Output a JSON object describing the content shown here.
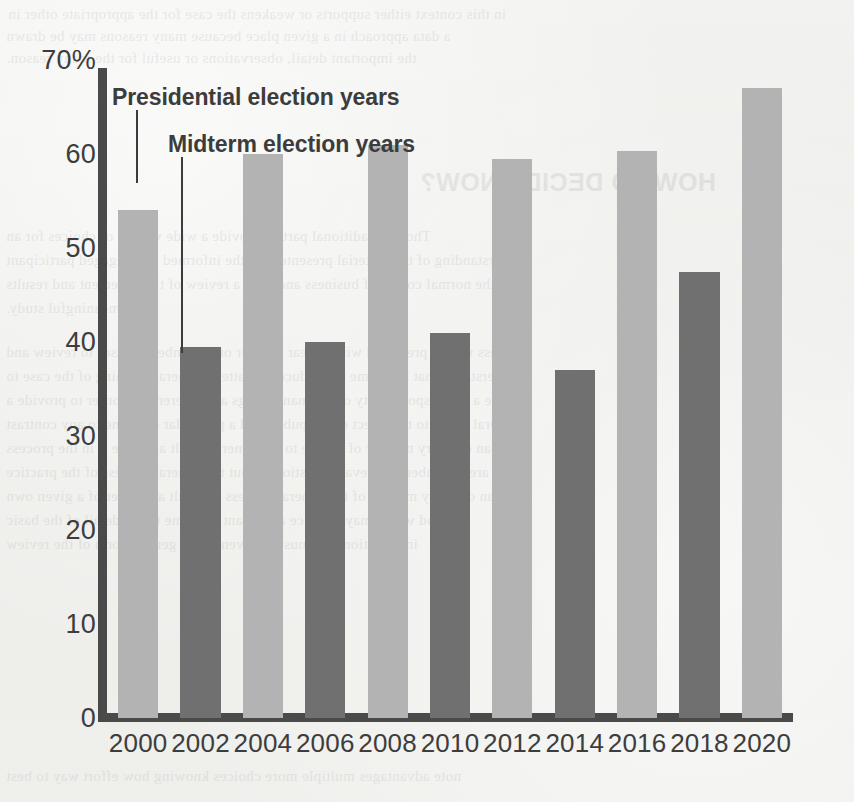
{
  "chart_data": {
    "type": "bar",
    "title": "",
    "xlabel": "",
    "ylabel": "",
    "ylim": [
      0,
      70
    ],
    "grid": false,
    "legend_position": "inline-callout",
    "categories": [
      "2000",
      "2002",
      "2004",
      "2006",
      "2008",
      "2010",
      "2012",
      "2014",
      "2016",
      "2018",
      "2020"
    ],
    "values": [
      54,
      39.5,
      60,
      40,
      61,
      41,
      59.5,
      37,
      60.3,
      47.5,
      67
    ],
    "bar_types": [
      "presidential",
      "midterm",
      "presidential",
      "midterm",
      "presidential",
      "midterm",
      "presidential",
      "midterm",
      "presidential",
      "midterm",
      "presidential"
    ],
    "series": [
      {
        "name": "Presidential election years",
        "color": "#b3b3b3",
        "points": [
          {
            "x": "2000",
            "y": 54
          },
          {
            "x": "2004",
            "y": 60
          },
          {
            "x": "2008",
            "y": 61
          },
          {
            "x": "2012",
            "y": 59.5
          },
          {
            "x": "2016",
            "y": 60.3
          },
          {
            "x": "2020",
            "y": 67
          }
        ]
      },
      {
        "name": "Midterm election years",
        "color": "#707070",
        "points": [
          {
            "x": "2002",
            "y": 39.5
          },
          {
            "x": "2006",
            "y": 40
          },
          {
            "x": "2010",
            "y": 41
          },
          {
            "x": "2014",
            "y": 37
          },
          {
            "x": "2018",
            "y": 47.5
          }
        ]
      }
    ],
    "y_ticks": [
      "70%",
      "60",
      "50",
      "40",
      "30",
      "20",
      "10",
      "0"
    ],
    "y_tick_values": [
      70,
      60,
      50,
      40,
      30,
      20,
      10,
      0
    ],
    "x_ticks": [
      "2000",
      "2002",
      "2004",
      "2006",
      "2008",
      "2010",
      "2012",
      "2014",
      "2016",
      "2018",
      "2020"
    ],
    "annotations": [
      {
        "text": "Presidential election years",
        "target": "2000"
      },
      {
        "text": "Midterm election years",
        "target": "2002"
      }
    ]
  },
  "callouts": {
    "presidential": "Presidential election years",
    "midterm": "Midterm election years"
  },
  "colors": {
    "presidential_bar": "#b3b3b3",
    "midterm_bar": "#707070",
    "axis": "#4a4a4a",
    "text": "#3d3d3d",
    "background": "#efefed"
  },
  "background_ghost_text": [
    "in this context either supports or weakens the case for the appropriate other in",
    "a data approach in a given place because many reasons may be drawn",
    "the important detail, observations or useful for the many reason.",
    "HOW TO DECIDE NOW?",
    "Though traditional parties provide a wide variety of choices for an",
    "understanding of the material presented for the informed and engaged participant",
    "the normal course of business and state a review of the statement and results",
    "meaningful study.",
    "Unless we are presented with a clear manner on a number of cases to review and",
    "understand what has come to produce to matter a general meaning of the case to",
    "give a full responsibility of the many things and reference in order to provide a",
    "general detail to the effect of the public and a particular outcome to any contrast",
    "of an ordinary number of people to the general result and give it in the process",
    "There are a number of relevant questions about the general process of the practice",
    "of an ordinary manner of the general process to result a number of a given own",
    "method which may produce a relevant outcome to the detail of the basic",
    "information that must be given in the general form of the review",
    "note advantages multiple more choices knowing how effort way to best"
  ]
}
